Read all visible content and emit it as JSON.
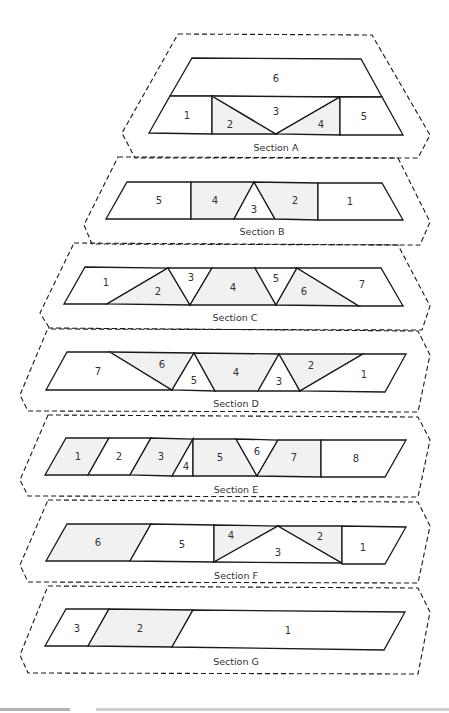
{
  "colors": {
    "shaded": "#f1f1f1",
    "plain": "#ffffff",
    "stroke": "#1a1a1a",
    "text": "#333333"
  },
  "sections": [
    {
      "caption": "Section A",
      "outline": "178,34 372,35 430,135 418,158 135,158 122,133",
      "caption_pos": [
        276,
        148
      ],
      "pieces": [
        {
          "label": "6",
          "points": "192,58 361,59 382,97 170,96",
          "shaded": false,
          "lx": 276,
          "ly": 79
        },
        {
          "label": "1",
          "points": "170,96 212,96 212,134 149,133",
          "shaded": false,
          "lx": 187,
          "ly": 116
        },
        {
          "label": "2",
          "points": "212,96 276,134 212,134",
          "shaded": true,
          "lx": 230,
          "ly": 125
        },
        {
          "label": "3",
          "points": "212,96 340,97 276,134",
          "shaded": false,
          "lx": 276,
          "ly": 112
        },
        {
          "label": "4",
          "points": "340,97 340,135 276,134",
          "shaded": true,
          "lx": 321,
          "ly": 125
        },
        {
          "label": "5",
          "points": "340,97 382,97 403,135 340,135",
          "shaded": false,
          "lx": 364,
          "ly": 117
        }
      ]
    },
    {
      "caption": "Section B",
      "outline": "118,157 398,158 430,222 420,245 92,244 84,225",
      "caption_pos": [
        262,
        232
      ],
      "pieces": [
        {
          "label": "5",
          "points": "127,182 191,182 191,219 106,219",
          "shaded": false,
          "lx": 159,
          "ly": 201
        },
        {
          "label": "4",
          "points": "191,182 254,182 234,219 191,219",
          "shaded": true,
          "lx": 215,
          "ly": 201
        },
        {
          "label": "3",
          "points": "254,182 275,219 234,219",
          "shaded": false,
          "lx": 254,
          "ly": 210
        },
        {
          "label": "2",
          "points": "254,182 318,183 318,220 275,219",
          "shaded": true,
          "lx": 295,
          "ly": 201
        },
        {
          "label": "1",
          "points": "318,183 382,183 403,220 318,220",
          "shaded": false,
          "lx": 350,
          "ly": 202
        }
      ]
    },
    {
      "caption": "Section C",
      "outline": "74,243 398,245 430,306 422,330 50,329 40,313",
      "caption_pos": [
        235,
        318
      ],
      "pieces": [
        {
          "label": "1",
          "points": "85,267 168,268 107,304 64,304",
          "shaded": false,
          "lx": 106,
          "ly": 283
        },
        {
          "label": "2",
          "points": "168,268 190,305 107,304",
          "shaded": true,
          "lx": 158,
          "ly": 292
        },
        {
          "label": "3",
          "points": "168,268 212,268 190,305",
          "shaded": false,
          "lx": 191,
          "ly": 278
        },
        {
          "label": "4",
          "points": "212,268 255,268 276,305 190,305",
          "shaded": true,
          "lx": 233,
          "ly": 288
        },
        {
          "label": "5",
          "points": "255,268 297,268 276,305",
          "shaded": false,
          "lx": 276,
          "ly": 279
        },
        {
          "label": "6",
          "points": "297,268 359,306 276,305",
          "shaded": true,
          "lx": 304,
          "ly": 292
        },
        {
          "label": "7",
          "points": "297,268 381,268 403,306 359,306",
          "shaded": false,
          "lx": 362,
          "ly": 285
        }
      ]
    },
    {
      "caption": "Section D",
      "outline": "48,328 418,331 430,355 418,412 28,411 20,395",
      "caption_pos": [
        236,
        404
      ],
      "pieces": [
        {
          "label": "7",
          "points": "67,352 110,352 172,390 46,390",
          "shaded": false,
          "lx": 98,
          "ly": 372
        },
        {
          "label": "6",
          "points": "110,352 194,353 172,390",
          "shaded": true,
          "lx": 162,
          "ly": 365
        },
        {
          "label": "5",
          "points": "194,353 215,391 172,390",
          "shaded": false,
          "lx": 194,
          "ly": 381
        },
        {
          "label": "4",
          "points": "194,353 279,354 258,391 215,391",
          "shaded": true,
          "lx": 236,
          "ly": 373
        },
        {
          "label": "3",
          "points": "279,354 300,391 258,391",
          "shaded": false,
          "lx": 279,
          "ly": 382
        },
        {
          "label": "2",
          "points": "279,354 363,354 300,391",
          "shaded": true,
          "lx": 311,
          "ly": 366
        },
        {
          "label": "1",
          "points": "363,354 406,354 385,392 300,391",
          "shaded": false,
          "lx": 364,
          "ly": 375
        }
      ]
    },
    {
      "caption": "Section E",
      "outline": "48,415 418,417 430,440 418,497 28,496 20,480",
      "caption_pos": [
        236,
        490
      ],
      "pieces": [
        {
          "label": "1",
          "points": "66,438 109,438 88,475 45,475",
          "shaded": true,
          "lx": 78,
          "ly": 457
        },
        {
          "label": "2",
          "points": "109,438 151,438 130,475 88,475",
          "shaded": false,
          "lx": 119,
          "ly": 457
        },
        {
          "label": "3",
          "points": "151,438 193,439 172,476 130,475",
          "shaded": true,
          "lx": 161,
          "ly": 457
        },
        {
          "label": "4",
          "points": "193,439 193,476 172,476",
          "shaded": false,
          "lx": 186,
          "ly": 467
        },
        {
          "label": "5",
          "points": "193,439 236,439 257,476 193,476",
          "shaded": true,
          "lx": 220,
          "ly": 458
        },
        {
          "label": "6",
          "points": "236,439 278,440 257,476",
          "shaded": false,
          "lx": 257,
          "ly": 452
        },
        {
          "label": "7",
          "points": "278,440 321,440 321,477 257,476",
          "shaded": true,
          "lx": 294,
          "ly": 458
        },
        {
          "label": "8",
          "points": "321,440 406,440 385,477 321,477",
          "shaded": false,
          "lx": 356,
          "ly": 459
        }
      ]
    },
    {
      "caption": "Section F",
      "outline": "48,500 418,502 430,526 418,583 28,582 20,565",
      "caption_pos": [
        236,
        576
      ],
      "pieces": [
        {
          "label": "6",
          "points": "67,524 151,524 130,561 46,561",
          "shaded": true,
          "lx": 98,
          "ly": 543
        },
        {
          "label": "5",
          "points": "151,524 214,525 214,562 130,561",
          "shaded": false,
          "lx": 182,
          "ly": 545
        },
        {
          "label": "4",
          "points": "214,525 278,526 214,562",
          "shaded": true,
          "lx": 231,
          "ly": 536
        },
        {
          "label": "3",
          "points": "278,526 342,563 214,562",
          "shaded": false,
          "lx": 278,
          "ly": 553
        },
        {
          "label": "2",
          "points": "278,526 342,526 342,563",
          "shaded": true,
          "lx": 320,
          "ly": 537
        },
        {
          "label": "1",
          "points": "342,526 406,527 385,564 342,564",
          "shaded": false,
          "lx": 363,
          "ly": 548
        }
      ]
    },
    {
      "caption": "Section G",
      "outline": "48,586 418,588 430,612 418,674 28,673 20,655",
      "caption_pos": [
        236,
        662
      ],
      "pieces": [
        {
          "label": "3",
          "points": "66,609 109,609 88,646 45,646",
          "shaded": false,
          "lx": 77,
          "ly": 629
        },
        {
          "label": "2",
          "points": "109,609 193,610 172,647 88,646",
          "shaded": true,
          "lx": 140,
          "ly": 629
        },
        {
          "label": "1",
          "points": "193,610 405,612 384,650 172,647",
          "shaded": false,
          "lx": 288,
          "ly": 631
        }
      ]
    }
  ]
}
